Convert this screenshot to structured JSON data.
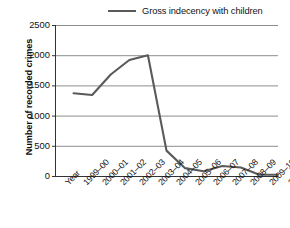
{
  "chart_data": {
    "type": "line",
    "title": "",
    "xlabel": "Year",
    "ylabel": "Number of recorded crimes",
    "ylim": [
      0,
      2500
    ],
    "ytick_values": [
      0,
      500,
      1000,
      1500,
      2000,
      2500
    ],
    "ytick_labels": [
      "0",
      "500",
      "1000",
      "1500",
      "2000",
      "2500"
    ],
    "grid": true,
    "grid_axis": "y",
    "legend_position": "top-center",
    "categories": [
      "1999–00",
      "2000–01",
      "2001–02",
      "2002–03",
      "2003–04",
      "2004–05",
      "2005–06",
      "2006–07",
      "2007–08",
      "2008–09",
      "2009–10",
      "2010–11"
    ],
    "x_axis_corner_label": "Year",
    "series": [
      {
        "name": "Gross indecency with children",
        "color": "#5a5a5a",
        "values": [
          1370,
          1340,
          1680,
          1920,
          2000,
          420,
          130,
          80,
          165,
          140,
          20,
          20
        ]
      }
    ]
  },
  "legend": {
    "items": [
      {
        "label": "Gross indecency with children",
        "color": "#5a5a5a"
      }
    ]
  },
  "axes": {
    "y_title": "Number of recorded crimes",
    "x_corner": "Year"
  },
  "colors": {
    "line": "#5a5a5a",
    "grid": "#808080",
    "axis": "#333333",
    "text": "#111111",
    "background": "#ffffff"
  }
}
